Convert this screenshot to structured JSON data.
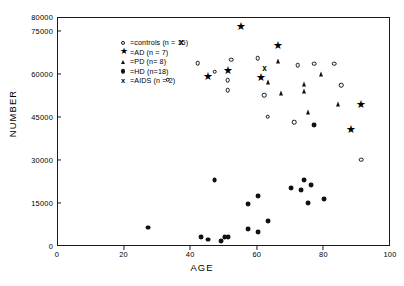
{
  "chart_data": {
    "type": "scatter",
    "title": "",
    "xlabel": "AGE",
    "ylabel": "NUMBER",
    "xlim": [
      0,
      100
    ],
    "ylim": [
      0,
      80000
    ],
    "xticks": [
      0,
      20,
      40,
      60,
      80,
      100
    ],
    "xticklabels": [
      "0",
      "20",
      "40",
      "60",
      "80",
      "100"
    ],
    "yticks": [
      0,
      15000,
      30000,
      45000,
      60000,
      75000,
      80000
    ],
    "yticklabels": [
      "0",
      "15000",
      "30000",
      "45000",
      "60000",
      "75000",
      "80000"
    ],
    "grid": false,
    "legend_position": "upper-left",
    "series": [
      {
        "name": "controls",
        "label": "controls (n = 15)",
        "marker": "open-circle",
        "n": 15,
        "points": [
          [
            33,
            58500
          ],
          [
            42,
            64200
          ],
          [
            47,
            61300
          ],
          [
            51,
            58300
          ],
          [
            51,
            54800
          ],
          [
            52,
            65500
          ],
          [
            60,
            66000
          ],
          [
            62,
            53000
          ],
          [
            63,
            45500
          ],
          [
            71,
            43500
          ],
          [
            72,
            63500
          ],
          [
            77,
            64100
          ],
          [
            83,
            64000
          ],
          [
            85,
            56500
          ],
          [
            91,
            30500
          ]
        ]
      },
      {
        "name": "AD",
        "label": "AD (n = 7)",
        "marker": "star",
        "n": 7,
        "points": [
          [
            45,
            59700
          ],
          [
            51,
            62000
          ],
          [
            55,
            77200
          ],
          [
            61,
            59500
          ],
          [
            66,
            70500
          ],
          [
            88,
            41200
          ],
          [
            91,
            50000
          ]
        ]
      },
      {
        "name": "PD",
        "label": "PD (n= 8)",
        "marker": "filled-triangle",
        "n": 8,
        "points": [
          [
            63,
            57800
          ],
          [
            66,
            64900
          ],
          [
            67,
            53800
          ],
          [
            74,
            57000
          ],
          [
            74,
            54500
          ],
          [
            75,
            47300
          ],
          [
            79,
            60300
          ],
          [
            84,
            50000
          ]
        ]
      },
      {
        "name": "HD",
        "label": "HD (n=18)",
        "marker": "filled-circle",
        "n": 18,
        "points": [
          [
            27,
            6800
          ],
          [
            43,
            3500
          ],
          [
            45,
            2600
          ],
          [
            49,
            2000
          ],
          [
            50,
            3400
          ],
          [
            51,
            3500
          ],
          [
            47,
            23500
          ],
          [
            57,
            15100
          ],
          [
            57,
            6200
          ],
          [
            60,
            17800
          ],
          [
            60,
            5300
          ],
          [
            63,
            9000
          ],
          [
            70,
            20700
          ],
          [
            73,
            20000
          ],
          [
            74,
            23300
          ],
          [
            76,
            21500
          ],
          [
            75,
            15300
          ],
          [
            77,
            42600
          ],
          [
            80,
            16600
          ]
        ]
      },
      {
        "name": "AIDS",
        "label": "AIDS (n = 2)",
        "marker": "x",
        "n": 2,
        "points": [
          [
            37,
            71300
          ],
          [
            62,
            62300
          ]
        ]
      }
    ]
  },
  "axis": {
    "x_title": "AGE",
    "y_title": "NUMBER"
  },
  "legend": {
    "entries": [
      {
        "eq": "=",
        "symbol": "open-circle",
        "text": "controls (n = 15)"
      },
      {
        "eq": "=",
        "symbol": "star",
        "text": "AD  (n = 7)"
      },
      {
        "eq": "=",
        "symbol": "filled-triangle",
        "text": "PD  (n= 8)"
      },
      {
        "eq": "=",
        "symbol": "filled-circle",
        "text": "HD  (n=18)"
      },
      {
        "eq": "=",
        "symbol": "x",
        "text": "AIDS  (n = 2)"
      }
    ]
  },
  "colors": {
    "ink": "#111111",
    "frame": "#1a1a1a",
    "background": "#ffffff"
  }
}
